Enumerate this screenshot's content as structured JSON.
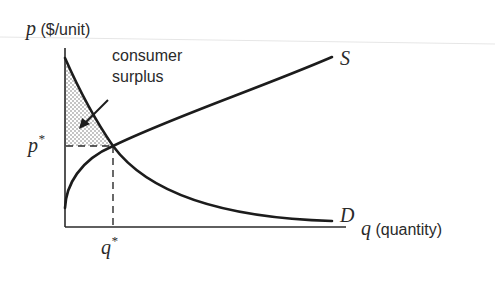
{
  "diagram": {
    "type": "supply-demand",
    "y_axis": {
      "var": "p",
      "unit": " ($/unit)"
    },
    "x_axis": {
      "var": "q",
      "unit": " (quantity)"
    },
    "curves": [
      {
        "label": "S",
        "name": "supply",
        "shape": "increasing concave"
      },
      {
        "label": "D",
        "name": "demand",
        "shape": "decreasing convex"
      }
    ],
    "equilibrium": {
      "price_label": "p",
      "quantity_label": "q",
      "marker": "*"
    },
    "annotation": {
      "line1": "consumer",
      "line2": "surplus"
    },
    "shaded_region": "consumer surplus (stippled area between demand curve and p*)"
  },
  "colors": {
    "ink": "#1c1c1c",
    "background": "#ffffff",
    "stipple": "#7a7a7a"
  }
}
